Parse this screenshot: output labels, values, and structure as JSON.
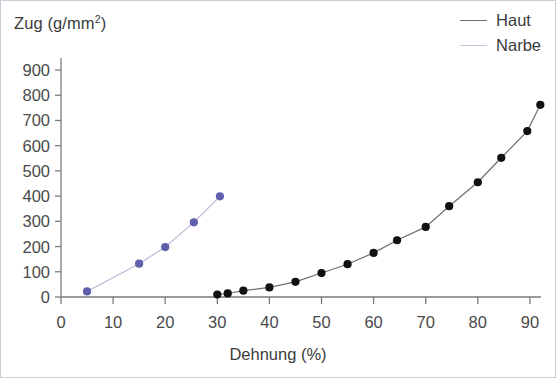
{
  "chart_data": {
    "type": "scatter",
    "title": "",
    "xlabel": "Dehnung (%)",
    "ylabel": "Zug (g/mm²)",
    "ylabel_base": "Zug (g/mm",
    "ylabel_sup": "2",
    "ylabel_close": ")",
    "xlim": [
      0,
      95
    ],
    "ylim": [
      0,
      950
    ],
    "xticks": [
      0,
      10,
      20,
      30,
      40,
      50,
      60,
      70,
      80,
      90
    ],
    "yticks": [
      0,
      100,
      200,
      300,
      400,
      500,
      600,
      700,
      800,
      900
    ],
    "grid": false,
    "legend_position": "top-right",
    "series": [
      {
        "name": "Haut",
        "color": "#111111",
        "line_color": "#6f6f6f",
        "marker": "circle",
        "x": [
          30,
          32,
          35,
          40,
          45,
          50,
          55,
          60,
          64.5,
          70,
          74.5,
          80,
          84.5,
          89.5,
          92
        ],
        "y": [
          10,
          14,
          25,
          38,
          60,
          95,
          130,
          175,
          225,
          278,
          360,
          455,
          552,
          658,
          762
        ]
      },
      {
        "name": "Narbe",
        "color": "#5e60ab",
        "line_color": "#b9bad8",
        "marker": "circle",
        "x": [
          5,
          15,
          20,
          25.5,
          30.5
        ],
        "y": [
          22,
          132,
          198,
          296,
          399
        ]
      }
    ]
  },
  "legend": {
    "items": [
      {
        "label": "Haut",
        "swatch_color": "#6f6f6f"
      },
      {
        "label": "Narbe",
        "swatch_color": "#c3c4de"
      }
    ]
  },
  "axes": {
    "y_tick_labels": [
      "900",
      "800",
      "700",
      "600",
      "500",
      "400",
      "300",
      "200",
      "100",
      "0"
    ],
    "x_tick_labels": [
      "0",
      "10",
      "20",
      "30",
      "40",
      "50",
      "60",
      "70",
      "80",
      "90"
    ]
  }
}
